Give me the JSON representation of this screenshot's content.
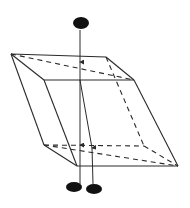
{
  "diagram": {
    "type": "birefringent-crystal-double-refraction",
    "colors": {
      "background": "#ffffff",
      "line": "#2a2a2a",
      "dot": "#111111"
    },
    "crystal": {
      "vertices": {
        "A": [
          11,
          54
        ],
        "B": [
          106,
          57
        ],
        "C": [
          134,
          80
        ],
        "D": [
          44,
          80
        ],
        "E": [
          44,
          145
        ],
        "F": [
          144,
          146
        ],
        "G": [
          178,
          166
        ],
        "H": [
          77,
          166
        ]
      },
      "solid_edges": [
        [
          "A",
          "B"
        ],
        [
          "B",
          "C"
        ],
        [
          "C",
          "D"
        ],
        [
          "D",
          "A"
        ],
        [
          "A",
          "E"
        ],
        [
          "D",
          "H"
        ],
        [
          "C",
          "G"
        ],
        [
          "E",
          "H"
        ],
        [
          "H",
          "G"
        ]
      ],
      "dashed_edges": [
        [
          "A",
          "C"
        ],
        [
          "B",
          "F"
        ],
        [
          "E",
          "F"
        ],
        [
          "F",
          "G"
        ],
        [
          "E",
          "G"
        ]
      ]
    },
    "rays": {
      "incident": {
        "from": [
          80,
          30
        ],
        "to": [
          80,
          80
        ],
        "arrow_at": [
          80,
          62
        ]
      },
      "ordinary": {
        "from": [
          80,
          80
        ],
        "to": [
          80,
          184
        ],
        "arrow_at": [
          80,
          145
        ]
      },
      "extraordinary": {
        "path": [
          [
            80,
            80
          ],
          [
            92,
            148
          ],
          [
            93,
            184
          ]
        ],
        "arrow_at": [
          92,
          148
        ]
      }
    },
    "spots": {
      "source": {
        "cx": 81,
        "cy": 23,
        "rx": 8,
        "ry": 6
      },
      "image_ordinary": {
        "cx": 74,
        "cy": 187,
        "rx": 8,
        "ry": 5
      },
      "image_extraordinary": {
        "cx": 94,
        "cy": 189,
        "rx": 8,
        "ry": 5
      }
    }
  }
}
